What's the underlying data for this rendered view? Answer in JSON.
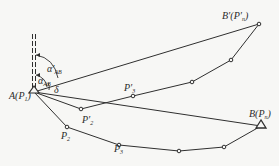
{
  "figure": {
    "type": "traverse-rotation-diagram",
    "labels": {
      "A": "A(P",
      "A_sub": "1",
      "A_close": ")",
      "B": "B(P",
      "B_sub": "n",
      "B_close": ")",
      "B_prime": "B′(P′",
      "B_prime_sub": "n",
      "B_prime_close": ")",
      "P2": "P",
      "P2_sub": "2",
      "P3": "P",
      "P3_sub": "3",
      "P2_prime": "P′",
      "P2_prime_sub": "2",
      "P3_prime": "P′",
      "P3_prime_sub": "3",
      "alpha_ab": "α",
      "alpha_ab_sub": "AB",
      "alpha_prime_ab": "α′",
      "alpha_prime_ab_sub": "AB",
      "delta": "δ"
    },
    "colors": {
      "line": "#2f2f2f",
      "background": "#f7f7f5"
    }
  }
}
